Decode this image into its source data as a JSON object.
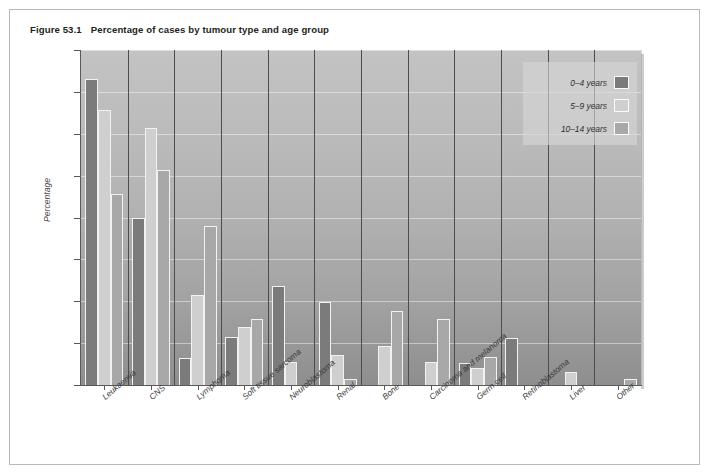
{
  "figure": {
    "number": "Figure 53.1",
    "caption": "Percentage of cases by tumour type and age group"
  },
  "colors": {
    "series_0_4": "#7b7b7b",
    "series_5_9": "#cfcfcf",
    "series_10_14": "#a8a8a8",
    "bar_outline": "#f2f2f2",
    "axis": "#58595b",
    "plot_bg_top": "#c3c3c3",
    "plot_bg_bottom": "#8e8e8e",
    "legend_bg": "#d6d6d6"
  },
  "chart_data": {
    "type": "bar",
    "title": "Percentage of cases by tumour type and age group",
    "xlabel": "",
    "ylabel": "Percentage",
    "ylim": [
      0,
      40
    ],
    "yticks": [
      0,
      5,
      10,
      15,
      20,
      25,
      30,
      35,
      40
    ],
    "ytick_labels": [
      "0",
      "5",
      "10",
      "15",
      "20",
      "25",
      "30",
      "35",
      "40"
    ],
    "grid": true,
    "legend_position": "top-right",
    "categories": [
      "Leukaemia",
      "CNS",
      "Lymphoma",
      "Soft tissue sarcoma",
      "Neuroblastoma",
      "Renal",
      "Bone",
      "Carcinoma and melanoma",
      "Germ cell",
      "Retinoblastoma",
      "Liver",
      "Other"
    ],
    "series": [
      {
        "name": "0–4 years",
        "color": "#7b7b7b",
        "values": [
          36.5,
          19.9,
          3.2,
          5.7,
          11.8,
          9.9,
          0,
          0,
          2.6,
          5.6,
          0,
          0
        ]
      },
      {
        "name": "5–9 years",
        "color": "#cfcfcf",
        "values": [
          32.8,
          30.7,
          10.8,
          6.9,
          2.8,
          3.6,
          4.6,
          2.7,
          2.0,
          0,
          1.5,
          0
        ]
      },
      {
        "name": "10–14 years",
        "color": "#a8a8a8",
        "values": [
          22.8,
          25.7,
          19.0,
          7.9,
          0,
          0.7,
          8.8,
          7.9,
          3.4,
          0,
          0,
          0.7
        ]
      }
    ]
  },
  "legend": {
    "items": [
      {
        "label": "0–4 years",
        "color": "#7b7b7b"
      },
      {
        "label": "5–9 years",
        "color": "#cfcfcf"
      },
      {
        "label": "10–14 years",
        "color": "#a8a8a8"
      }
    ]
  }
}
